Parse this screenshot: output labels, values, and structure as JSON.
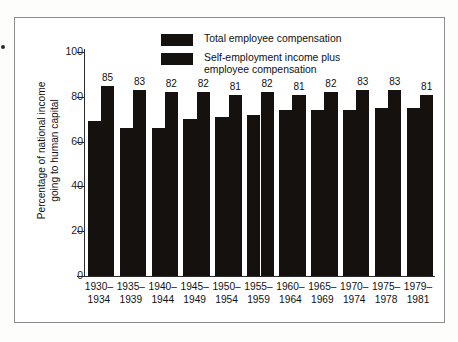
{
  "chart_data": {
    "type": "bar",
    "title": "",
    "xlabel": "",
    "ylabel": "Percentage of national income going to human capital",
    "ylabel_lines": [
      "Percentage of national income",
      "going to human capital"
    ],
    "ylim": [
      0,
      100
    ],
    "yticks": [
      0,
      20,
      40,
      60,
      80,
      100
    ],
    "ytick_labels": [
      "0",
      "20",
      "40",
      "60",
      "80",
      "100"
    ],
    "grid": false,
    "legend_position": "top-center",
    "categories": [
      "1930–\n1934",
      "1935–\n1939",
      "1940–\n1944",
      "1945–\n1949",
      "1950–\n1954",
      "1955–\n1959",
      "1960–\n1964",
      "1965–\n1969",
      "1970–\n1974",
      "1975–\n1978",
      "1979–\n1981"
    ],
    "series": [
      {
        "name": "Total employee compensation",
        "color": "#15110f",
        "values": [
          69,
          66,
          66,
          70,
          71,
          72,
          74,
          74,
          74,
          75,
          75
        ],
        "labels": [
          "",
          "",
          "",
          "",
          "",
          "",
          "",
          "",
          "",
          "",
          ""
        ]
      },
      {
        "name": "Self-employment income plus employee compensation",
        "color": "#15110f",
        "values": [
          85,
          83,
          82,
          82,
          81,
          82,
          81,
          82,
          83,
          83,
          81
        ],
        "labels": [
          "85",
          "83",
          "82",
          "82",
          "81",
          "82",
          "81",
          "82",
          "83",
          "83",
          "81"
        ]
      }
    ]
  },
  "legend": {
    "items": [
      {
        "label": "Total employee compensation",
        "swatch": "#15110f"
      },
      {
        "label": "Self-employment income plus\nemployee compensation",
        "swatch": "#15110f"
      }
    ]
  },
  "axes": {
    "y_title_line1": "Percentage of national income",
    "y_title_line2": "going to human capital",
    "y_tick_100": "100",
    "y_tick_80": "80",
    "y_tick_60": "60",
    "y_tick_40": "40",
    "y_tick_20": "20",
    "y_tick_0": "0"
  },
  "xaxis_labels": [
    "1930–\n1934",
    "1935–\n1939",
    "1940–\n1944",
    "1945–\n1949",
    "1950–\n1954",
    "1955–\n1959",
    "1960–\n1964",
    "1965–\n1969",
    "1970–\n1974",
    "1975–\n1978",
    "1979–\n1981"
  ],
  "value_labels": [
    "85",
    "83",
    "82",
    "82",
    "81",
    "82",
    "81",
    "82",
    "83",
    "83",
    "81"
  ]
}
